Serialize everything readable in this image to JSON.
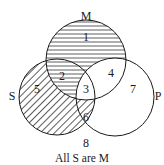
{
  "diagram": {
    "type": "venn",
    "caption": "All S are M",
    "sets": [
      {
        "name": "M",
        "label": "M"
      },
      {
        "name": "S",
        "label": "S"
      },
      {
        "name": "P",
        "label": "P"
      }
    ],
    "regions": [
      {
        "id": "1",
        "label": "1",
        "shading": "horizontal"
      },
      {
        "id": "2",
        "label": "2",
        "shading": "horizontal"
      },
      {
        "id": "3",
        "label": "3",
        "shading": "none"
      },
      {
        "id": "4",
        "label": "4",
        "shading": "none"
      },
      {
        "id": "5",
        "label": "5",
        "shading": "diagonal"
      },
      {
        "id": "6",
        "label": "6",
        "shading": "diagonal"
      },
      {
        "id": "7",
        "label": "7",
        "shading": "none"
      },
      {
        "id": "8",
        "label": "8",
        "shading": "none"
      }
    ],
    "colors": {
      "stroke": "#1a1a1a",
      "background": "#ffffff"
    }
  }
}
